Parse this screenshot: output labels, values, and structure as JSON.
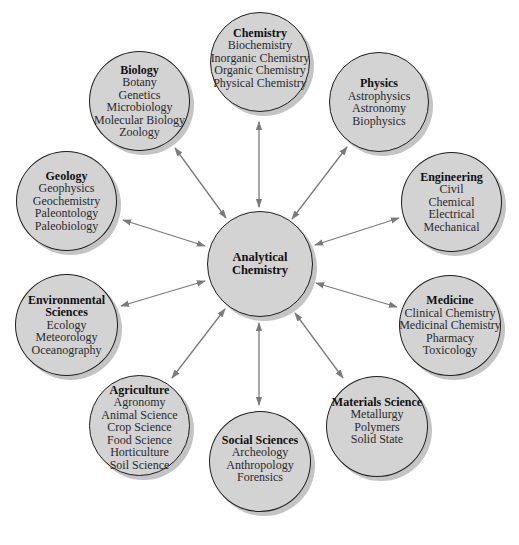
{
  "diagram": {
    "center": {
      "title_lines": [
        "Analytical",
        "Chemistry"
      ]
    },
    "nodes": [
      {
        "id": "chemistry",
        "title": "Chemistry",
        "items": [
          "Biochemistry",
          "Inorganic Chemistry",
          "Organic Chemistry",
          "Physical Chemistry"
        ]
      },
      {
        "id": "biology",
        "title": "Biology",
        "items": [
          "Botany",
          "Genetics",
          "Microbiology",
          "Molecular Biology",
          "Zoology"
        ]
      },
      {
        "id": "physics",
        "title": "Physics",
        "items": [
          "Astrophysics",
          "Astronomy",
          "Biophysics"
        ]
      },
      {
        "id": "geology",
        "title": "Geology",
        "items": [
          "Geophysics",
          "Geochemistry",
          "Paleontology",
          "Paleobiology"
        ]
      },
      {
        "id": "engineering",
        "title": "Engineering",
        "items": [
          "Civil",
          "Chemical",
          "Electrical",
          "Mechanical"
        ]
      },
      {
        "id": "environmental-sciences",
        "title": "Environmental Sciences",
        "title_lines": [
          "Environmental",
          "Sciences"
        ],
        "items": [
          "Ecology",
          "Meteorology",
          "Oceanography"
        ]
      },
      {
        "id": "medicine",
        "title": "Medicine",
        "items": [
          "Clinical Chemistry",
          "Medicinal Chemistry",
          "Pharmacy",
          "Toxicology"
        ]
      },
      {
        "id": "agriculture",
        "title": "Agriculture",
        "items": [
          "Agronomy",
          "Animal Science",
          "Crop Science",
          "Food Science",
          "Horticulture",
          "Soil Science"
        ]
      },
      {
        "id": "materials-science",
        "title": "Materials Science",
        "items": [
          "Metallurgy",
          "Polymers",
          "Solid State"
        ]
      },
      {
        "id": "social-sciences",
        "title": "Social Sciences",
        "items": [
          "Archeology",
          "Anthropology",
          "Forensics"
        ]
      }
    ],
    "colors": {
      "node_fill": "#d3d3d3",
      "node_border": "#1e1e1e",
      "arrow": "#7a7a7a",
      "shadow": "#c4c4c4"
    },
    "edges": "bidirectional arrows between Analytical Chemistry and each discipline"
  }
}
